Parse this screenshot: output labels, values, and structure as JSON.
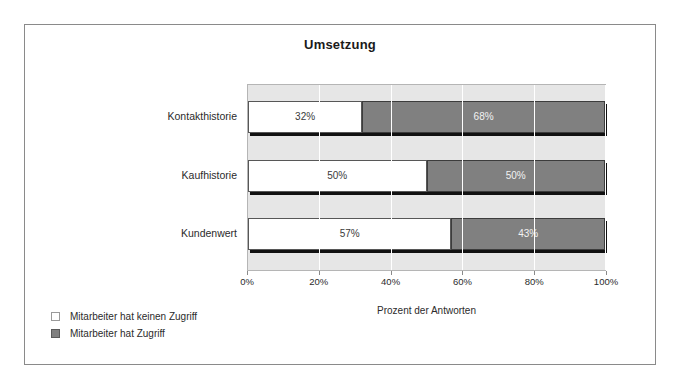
{
  "chart_data": {
    "type": "bar",
    "orientation": "horizontal",
    "stacked": true,
    "stack_mode": "percent",
    "title": "Umsetzung",
    "xlabel": "Prozent der Antworten",
    "ylabel": "",
    "categories": [
      "Kontakthistorie",
      "Kaufhistorie",
      "Kundenwert"
    ],
    "series": [
      {
        "name": "Mitarbeiter hat keinen Zugriff",
        "color": "#ffffff",
        "values": [
          32,
          50,
          57
        ],
        "labels": [
          "32%",
          "50%",
          "57%"
        ]
      },
      {
        "name": "Mitarbeiter hat Zugriff",
        "color": "#808080",
        "values": [
          68,
          50,
          43
        ],
        "labels": [
          "68%",
          "50%",
          "43%"
        ]
      }
    ],
    "xlim": [
      0,
      100
    ],
    "xticks": [
      0,
      20,
      40,
      60,
      80,
      100
    ],
    "xtick_labels": [
      "0%",
      "20%",
      "40%",
      "60%",
      "80%",
      "100%"
    ],
    "grid": "vertical",
    "legend_position": "bottom-left",
    "plot_background": "#e6e6e6",
    "frame_border": "#8a8a8a"
  },
  "legend": {
    "items": [
      {
        "label": "Mitarbeiter hat keinen Zugriff",
        "swatch": "no-access-swatch"
      },
      {
        "label": "Mitarbeiter hat Zugriff",
        "swatch": "access-swatch"
      }
    ]
  }
}
